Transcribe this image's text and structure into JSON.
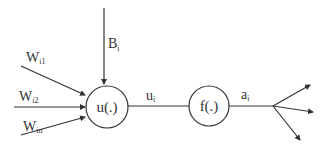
{
  "diagram": {
    "type": "artificial-neuron",
    "colors": {
      "stroke": "#333333",
      "background": "#ffffff",
      "text": "#333333"
    },
    "bias": {
      "main": "B",
      "sub": "i"
    },
    "inputs": [
      {
        "main": "W",
        "sub": "i1"
      },
      {
        "main": "W",
        "sub": "i2"
      },
      {
        "main": "W",
        "sub": "in"
      }
    ],
    "nodes": {
      "summation": {
        "label": "u(.)"
      },
      "activation": {
        "label": "f(.)"
      }
    },
    "edges": {
      "sum_to_activation": {
        "main": "u",
        "sub": "i"
      },
      "output": {
        "main": "a",
        "sub": "i"
      }
    },
    "output_branches": 3
  }
}
